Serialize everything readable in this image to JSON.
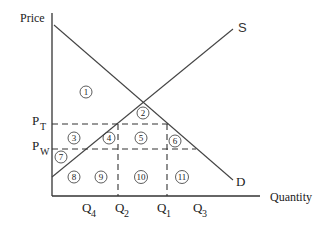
{
  "diagram": {
    "type": "supply-demand-tariff",
    "axes": {
      "y_label": "Price",
      "x_label": "Quantity"
    },
    "curves": {
      "supply_label": "S",
      "demand_label": "D"
    },
    "price_levels": {
      "tariff": {
        "main": "P",
        "sub": "T"
      },
      "world": {
        "main": "P",
        "sub": "W"
      }
    },
    "quantity_levels": [
      {
        "main": "Q",
        "sub": "4"
      },
      {
        "main": "Q",
        "sub": "2"
      },
      {
        "main": "Q",
        "sub": "1"
      },
      {
        "main": "Q",
        "sub": "3"
      }
    ],
    "areas": [
      "1",
      "2",
      "3",
      "4",
      "5",
      "6",
      "7",
      "8",
      "9",
      "10",
      "11"
    ]
  }
}
